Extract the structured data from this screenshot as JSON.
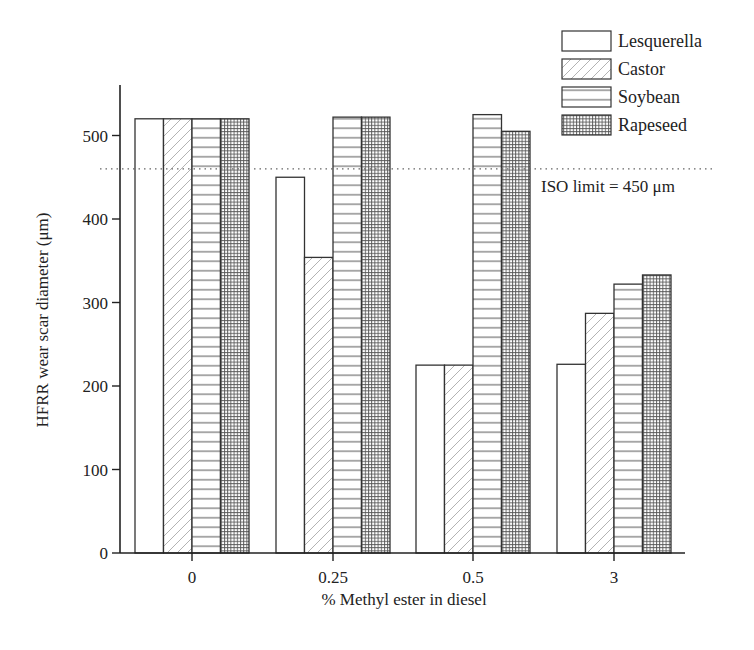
{
  "chart_data": {
    "type": "bar",
    "title": "",
    "xlabel": "% Methyl ester in diesel",
    "ylabel": "HFRR wear scar diameter (μm)",
    "categories": [
      "0",
      "0.25",
      "0.5",
      "3"
    ],
    "series": [
      {
        "name": "Lesquerella",
        "pattern": "blank",
        "values": [
          520,
          450,
          225,
          226
        ]
      },
      {
        "name": "Castor",
        "pattern": "diagonal",
        "values": [
          520,
          354,
          225,
          287
        ]
      },
      {
        "name": "Soybean",
        "pattern": "horizontal",
        "values": [
          520,
          522,
          525,
          322
        ]
      },
      {
        "name": "Rapeseed",
        "pattern": "grid",
        "values": [
          520,
          522,
          505,
          333
        ]
      }
    ],
    "ylim": [
      0,
      560
    ],
    "yticks": [
      0,
      100,
      200,
      300,
      400,
      500
    ],
    "grid": false,
    "legend_position": "top-right",
    "reference_line": {
      "value": 460,
      "style": "dotted",
      "label": "ISO limit = 450 μm"
    }
  }
}
